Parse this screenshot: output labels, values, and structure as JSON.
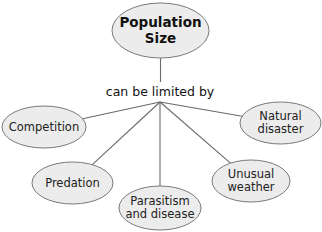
{
  "root": {
    "label": "Population\nSize",
    "cx": 160.5,
    "cy": 30.5,
    "rx": 48.5,
    "ry": 27.5
  },
  "connector": {
    "label": "can be limited by",
    "hub": {
      "x": 160,
      "y": 102
    }
  },
  "colors": {
    "fill": "#ececec",
    "stroke": "#7a7a7a",
    "line": "#6a6a6a",
    "text": "#222222"
  },
  "factors": [
    {
      "id": "competition",
      "label": "Competition",
      "cx": 44,
      "cy": 127,
      "rx": 42,
      "ry": 21
    },
    {
      "id": "predation",
      "label": "Predation",
      "cx": 72.5,
      "cy": 183,
      "rx": 40.5,
      "ry": 21
    },
    {
      "id": "parasitism",
      "label": "Parasitism\nand disease",
      "cx": 160,
      "cy": 208,
      "rx": 41,
      "ry": 22
    },
    {
      "id": "unusual-weather",
      "label": "Unusual\nweather",
      "cx": 251,
      "cy": 181,
      "rx": 39,
      "ry": 21
    },
    {
      "id": "natural-disaster",
      "label": "Natural\ndisaster",
      "cx": 280.5,
      "cy": 123,
      "rx": 40.5,
      "ry": 21
    }
  ]
}
